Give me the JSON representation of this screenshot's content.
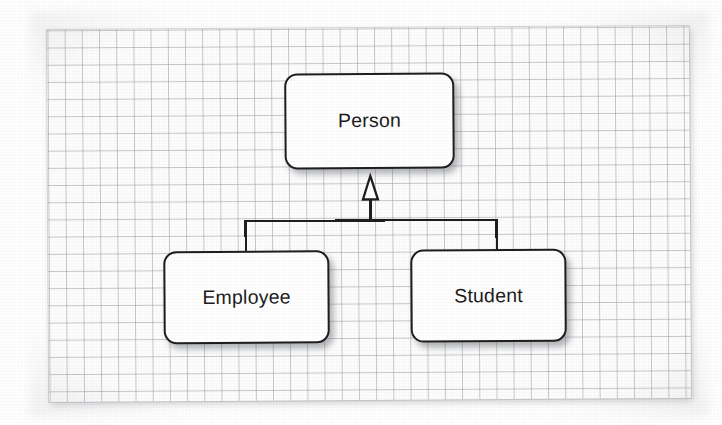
{
  "diagram": {
    "kind": "uml-class-inheritance",
    "canvas": {
      "background_color": "#fdfdfd",
      "grid_color": "#969aa0",
      "grid_cell_px": 17,
      "grid_visible": "true"
    },
    "style": {
      "box_fill": "#ffffff",
      "box_stroke": "#1d1d1f",
      "text_color": "#1b1b1d",
      "connector_color": "#1d1d1f",
      "arrowhead": "hollow-triangle"
    },
    "nodes": [
      {
        "id": "person",
        "label": "Person",
        "role": "superclass",
        "x": 285,
        "y": 73,
        "width": 170,
        "height": 96
      },
      {
        "id": "employee",
        "label": "Employee",
        "role": "subclass",
        "x": 163,
        "y": 250,
        "width": 166,
        "height": 93
      },
      {
        "id": "student",
        "label": "Student",
        "role": "subclass",
        "x": 410,
        "y": 250,
        "width": 156,
        "height": 93
      }
    ],
    "edges": [
      {
        "id": "employee-to-person",
        "from": "employee",
        "to": "person",
        "relation": "generalization",
        "label": ""
      },
      {
        "id": "student-to-person",
        "from": "student",
        "to": "person",
        "relation": "generalization",
        "label": ""
      }
    ]
  }
}
